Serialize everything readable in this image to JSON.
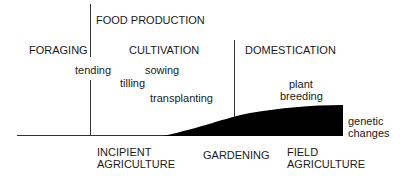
{
  "diagram": {
    "top_labels": {
      "food_production": "FOOD PRODUCTION",
      "foraging": "FORAGING",
      "cultivation": "CULTIVATION",
      "domestication": "DOMESTICATION"
    },
    "activities": {
      "tending": "tending",
      "tilling": "tilling",
      "sowing": "sowing",
      "transplanting": "transplanting",
      "plant": "plant",
      "breeding": "breeding"
    },
    "curve_label": {
      "line1": "genetic",
      "line2": "changes"
    },
    "bottom_labels": {
      "incipient_line1": "INCIPIENT",
      "incipient_line2": "AGRICULTURE",
      "gardening": "GARDENING",
      "field_line1": "FIELD",
      "field_line2": "AGRICULTURE"
    },
    "colors": {
      "ink": "#1a1a1a",
      "fill": "#000000"
    }
  }
}
